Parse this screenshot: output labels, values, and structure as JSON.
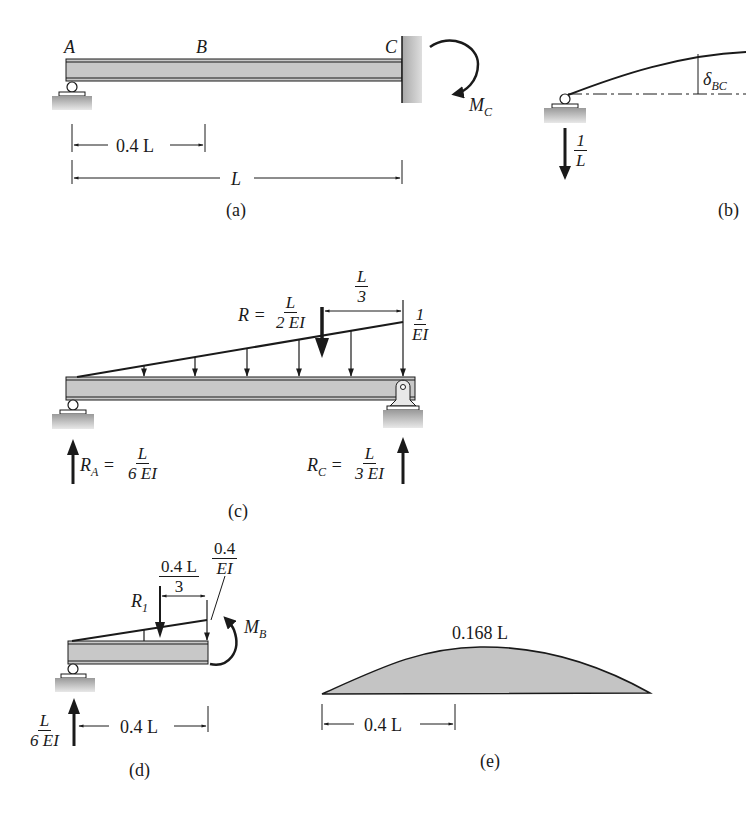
{
  "panel_a": {
    "caption": "(a)",
    "point_a": "A",
    "point_b": "B",
    "point_c": "C",
    "moment_label": "M",
    "moment_sub": "C",
    "dim_partial": "0.4 L",
    "dim_total": "L"
  },
  "panel_b": {
    "caption": "(b)",
    "delta_label": "δ",
    "delta_sub": "BC",
    "load_num": "1",
    "load_den": "L"
  },
  "panel_c": {
    "caption": "(c)",
    "resultant_prefix": "R =",
    "resultant_num": "L",
    "resultant_den": "2 EI",
    "lever_num": "L",
    "lever_den": "3",
    "max_load_num": "1",
    "max_load_den": "EI",
    "ra_label": "R",
    "ra_sub": "A",
    "ra_eq": "=",
    "ra_num": "L",
    "ra_den": "6 EI",
    "rc_label": "R",
    "rc_sub": "C",
    "rc_eq": "=",
    "rc_num": "L",
    "rc_den": "3 EI"
  },
  "panel_d": {
    "caption": "(d)",
    "r1_label": "R",
    "r1_sub": "1",
    "lever_num": "0.4 L",
    "lever_den": "3",
    "load_num": "0.4",
    "load_den": "EI",
    "moment_label": "M",
    "moment_sub": "B",
    "reaction_num": "L",
    "reaction_den": "6 EI",
    "dim": "0.4 L"
  },
  "panel_e": {
    "caption": "(e)",
    "peak_label": "0.168 L",
    "dim": "0.4 L"
  },
  "colors": {
    "beam_fill": "#c8c8c8",
    "ink": "#1a1a1a",
    "wall_fill": "#b4b4b4",
    "diagram_fill": "#c4c4c4"
  }
}
